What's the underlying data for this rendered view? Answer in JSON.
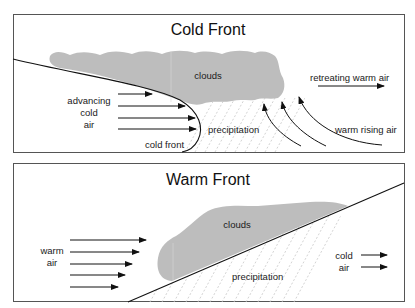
{
  "cold_front": {
    "title": "Cold Front",
    "labels": {
      "clouds": "clouds",
      "advancing_1": "advancing",
      "advancing_2": "cold",
      "advancing_3": "air",
      "cold_front": "cold front",
      "precipitation": "precipitation",
      "retreating": "retreating warm air",
      "rising": "warm rising air"
    }
  },
  "warm_front": {
    "title": "Warm Front",
    "labels": {
      "clouds": "clouds",
      "warm_1": "warm",
      "warm_2": "air",
      "precipitation": "precipitation",
      "cold_1": "cold",
      "cold_2": "air"
    }
  },
  "colors": {
    "cloud": "#bdbdbd",
    "line": "#111111",
    "border": "#555555",
    "hatch": "#c8c8c8"
  }
}
